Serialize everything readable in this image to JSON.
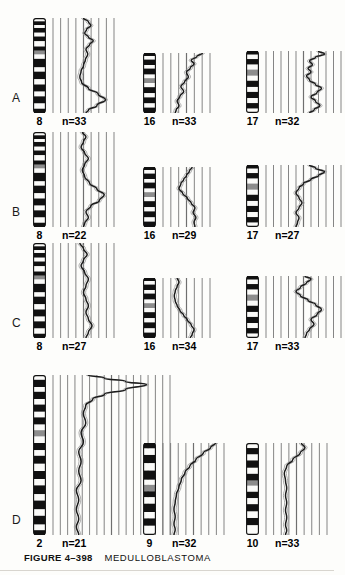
{
  "figure": {
    "number": "FIGURE 4–398",
    "title": "MEDULLOBLASTOMA"
  },
  "panels": [
    {
      "letter": "A",
      "plots": [
        {
          "chromosome": "8",
          "n_label": "n=33"
        },
        {
          "chromosome": "16",
          "n_label": "n=33"
        },
        {
          "chromosome": "17",
          "n_label": "n=32"
        }
      ]
    },
    {
      "letter": "B",
      "plots": [
        {
          "chromosome": "8",
          "n_label": "n=22"
        },
        {
          "chromosome": "16",
          "n_label": "n=29"
        },
        {
          "chromosome": "17",
          "n_label": "n=27"
        }
      ]
    },
    {
      "letter": "C",
      "plots": [
        {
          "chromosome": "8",
          "n_label": "n=27"
        },
        {
          "chromosome": "16",
          "n_label": "n=34"
        },
        {
          "chromosome": "17",
          "n_label": "n=33"
        }
      ]
    },
    {
      "letter": "D",
      "plots": [
        {
          "chromosome": "2",
          "n_label": "n=21"
        },
        {
          "chromosome": "9",
          "n_label": "n=32"
        },
        {
          "chromosome": "10",
          "n_label": "n=33"
        }
      ]
    }
  ],
  "chart_data": {
    "type": "line",
    "title": "MEDULLOBLASTOMA",
    "xlabel": "fluorescence ratio",
    "ylabel": "chromosome position (p → q)",
    "grid": true,
    "legend": "none",
    "panels": [
      {
        "panel": "A",
        "plots": [
          {
            "chromosome": "8",
            "n": 33,
            "gridlines": 9,
            "arm_split": 0.38,
            "profile": [
              [
                0.5,
                0.0
              ],
              [
                0.58,
                0.04
              ],
              [
                0.62,
                0.08
              ],
              [
                0.55,
                0.12
              ],
              [
                0.52,
                0.16
              ],
              [
                0.58,
                0.2
              ],
              [
                0.66,
                0.24
              ],
              [
                0.6,
                0.28
              ],
              [
                0.54,
                0.33
              ],
              [
                0.57,
                0.38
              ],
              [
                0.53,
                0.44
              ],
              [
                0.5,
                0.5
              ],
              [
                0.46,
                0.56
              ],
              [
                0.44,
                0.62
              ],
              [
                0.47,
                0.68
              ],
              [
                0.58,
                0.74
              ],
              [
                0.74,
                0.8
              ],
              [
                0.86,
                0.86
              ],
              [
                0.72,
                0.92
              ],
              [
                0.58,
                0.97
              ],
              [
                0.54,
                1.0
              ]
            ]
          },
          {
            "chromosome": "16",
            "n": 33,
            "gridlines": 7,
            "arm_split": 0.42,
            "profile": [
              [
                0.84,
                0.0
              ],
              [
                0.72,
                0.06
              ],
              [
                0.6,
                0.12
              ],
              [
                0.66,
                0.18
              ],
              [
                0.58,
                0.25
              ],
              [
                0.5,
                0.32
              ],
              [
                0.54,
                0.4
              ],
              [
                0.46,
                0.48
              ],
              [
                0.38,
                0.56
              ],
              [
                0.44,
                0.64
              ],
              [
                0.36,
                0.72
              ],
              [
                0.3,
                0.8
              ],
              [
                0.34,
                0.88
              ],
              [
                0.28,
                0.95
              ],
              [
                0.26,
                1.0
              ]
            ]
          },
          {
            "chromosome": "17",
            "n": 32,
            "gridlines": 11,
            "arm_split": 0.4,
            "profile": [
              [
                0.7,
                0.0
              ],
              [
                0.78,
                0.05
              ],
              [
                0.66,
                0.1
              ],
              [
                0.58,
                0.16
              ],
              [
                0.62,
                0.22
              ],
              [
                0.56,
                0.28
              ],
              [
                0.6,
                0.34
              ],
              [
                0.54,
                0.4
              ],
              [
                0.58,
                0.47
              ],
              [
                0.66,
                0.54
              ],
              [
                0.74,
                0.6
              ],
              [
                0.68,
                0.67
              ],
              [
                0.6,
                0.74
              ],
              [
                0.66,
                0.81
              ],
              [
                0.72,
                0.88
              ],
              [
                0.64,
                0.95
              ],
              [
                0.58,
                1.0
              ]
            ]
          }
        ]
      },
      {
        "panel": "B",
        "plots": [
          {
            "chromosome": "8",
            "n": 22,
            "gridlines": 9,
            "arm_split": 0.38,
            "profile": [
              [
                0.48,
                0.0
              ],
              [
                0.54,
                0.05
              ],
              [
                0.5,
                0.1
              ],
              [
                0.46,
                0.16
              ],
              [
                0.52,
                0.22
              ],
              [
                0.58,
                0.28
              ],
              [
                0.52,
                0.34
              ],
              [
                0.48,
                0.4
              ],
              [
                0.52,
                0.47
              ],
              [
                0.6,
                0.54
              ],
              [
                0.72,
                0.6
              ],
              [
                0.84,
                0.66
              ],
              [
                0.76,
                0.72
              ],
              [
                0.62,
                0.78
              ],
              [
                0.54,
                0.84
              ],
              [
                0.58,
                0.9
              ],
              [
                0.52,
                0.96
              ],
              [
                0.5,
                1.0
              ]
            ]
          },
          {
            "chromosome": "16",
            "n": 29,
            "gridlines": 7,
            "arm_split": 0.42,
            "profile": [
              [
                0.62,
                0.0
              ],
              [
                0.56,
                0.07
              ],
              [
                0.5,
                0.14
              ],
              [
                0.44,
                0.21
              ],
              [
                0.38,
                0.28
              ],
              [
                0.34,
                0.36
              ],
              [
                0.42,
                0.44
              ],
              [
                0.52,
                0.52
              ],
              [
                0.6,
                0.6
              ],
              [
                0.68,
                0.68
              ],
              [
                0.64,
                0.76
              ],
              [
                0.7,
                0.84
              ],
              [
                0.66,
                0.92
              ],
              [
                0.68,
                1.0
              ]
            ]
          },
          {
            "chromosome": "17",
            "n": 27,
            "gridlines": 11,
            "arm_split": 0.4,
            "profile": [
              [
                0.58,
                0.0
              ],
              [
                0.66,
                0.05
              ],
              [
                0.78,
                0.11
              ],
              [
                0.7,
                0.17
              ],
              [
                0.6,
                0.23
              ],
              [
                0.5,
                0.3
              ],
              [
                0.44,
                0.37
              ],
              [
                0.4,
                0.45
              ],
              [
                0.44,
                0.53
              ],
              [
                0.48,
                0.61
              ],
              [
                0.44,
                0.69
              ],
              [
                0.4,
                0.77
              ],
              [
                0.44,
                0.85
              ],
              [
                0.42,
                0.93
              ],
              [
                0.4,
                1.0
              ]
            ]
          }
        ]
      },
      {
        "panel": "C",
        "plots": [
          {
            "chromosome": "8",
            "n": 27,
            "gridlines": 9,
            "arm_split": 0.38,
            "profile": [
              [
                0.44,
                0.0
              ],
              [
                0.5,
                0.06
              ],
              [
                0.56,
                0.12
              ],
              [
                0.5,
                0.18
              ],
              [
                0.46,
                0.24
              ],
              [
                0.52,
                0.31
              ],
              [
                0.58,
                0.38
              ],
              [
                0.54,
                0.45
              ],
              [
                0.5,
                0.52
              ],
              [
                0.54,
                0.59
              ],
              [
                0.58,
                0.66
              ],
              [
                0.54,
                0.73
              ],
              [
                0.58,
                0.8
              ],
              [
                0.64,
                0.87
              ],
              [
                0.58,
                0.94
              ],
              [
                0.54,
                1.0
              ]
            ]
          },
          {
            "chromosome": "16",
            "n": 34,
            "gridlines": 7,
            "arm_split": 0.42,
            "profile": [
              [
                0.3,
                0.0
              ],
              [
                0.34,
                0.07
              ],
              [
                0.3,
                0.14
              ],
              [
                0.26,
                0.22
              ],
              [
                0.24,
                0.3
              ],
              [
                0.26,
                0.38
              ],
              [
                0.3,
                0.46
              ],
              [
                0.36,
                0.54
              ],
              [
                0.44,
                0.62
              ],
              [
                0.52,
                0.7
              ],
              [
                0.6,
                0.78
              ],
              [
                0.66,
                0.86
              ],
              [
                0.62,
                0.94
              ],
              [
                0.58,
                1.0
              ]
            ]
          },
          {
            "chromosome": "17",
            "n": 33,
            "gridlines": 11,
            "arm_split": 0.4,
            "profile": [
              [
                0.52,
                0.0
              ],
              [
                0.6,
                0.05
              ],
              [
                0.54,
                0.11
              ],
              [
                0.46,
                0.18
              ],
              [
                0.4,
                0.25
              ],
              [
                0.46,
                0.32
              ],
              [
                0.56,
                0.39
              ],
              [
                0.66,
                0.46
              ],
              [
                0.74,
                0.54
              ],
              [
                0.68,
                0.62
              ],
              [
                0.6,
                0.7
              ],
              [
                0.64,
                0.78
              ],
              [
                0.58,
                0.86
              ],
              [
                0.54,
                0.93
              ],
              [
                0.52,
                1.0
              ]
            ]
          }
        ]
      },
      {
        "panel": "D",
        "plots": [
          {
            "chromosome": "2",
            "n": 21,
            "gridlines": 17,
            "arm_split": 0.38,
            "profile": [
              [
                0.3,
                0.0
              ],
              [
                0.44,
                0.02
              ],
              [
                0.62,
                0.04
              ],
              [
                0.8,
                0.06
              ],
              [
                0.62,
                0.09
              ],
              [
                0.44,
                0.12
              ],
              [
                0.34,
                0.15
              ],
              [
                0.28,
                0.19
              ],
              [
                0.26,
                0.24
              ],
              [
                0.28,
                0.3
              ],
              [
                0.24,
                0.36
              ],
              [
                0.26,
                0.42
              ],
              [
                0.22,
                0.48
              ],
              [
                0.24,
                0.54
              ],
              [
                0.22,
                0.6
              ],
              [
                0.24,
                0.66
              ],
              [
                0.2,
                0.72
              ],
              [
                0.22,
                0.78
              ],
              [
                0.2,
                0.84
              ],
              [
                0.22,
                0.9
              ],
              [
                0.2,
                0.95
              ],
              [
                0.22,
                1.0
              ]
            ]
          },
          {
            "chromosome": "9",
            "n": 32,
            "gridlines": 9,
            "arm_split": 0.46,
            "profile": [
              [
                0.86,
                0.0
              ],
              [
                0.78,
                0.05
              ],
              [
                0.66,
                0.11
              ],
              [
                0.54,
                0.18
              ],
              [
                0.44,
                0.25
              ],
              [
                0.36,
                0.32
              ],
              [
                0.3,
                0.4
              ],
              [
                0.26,
                0.48
              ],
              [
                0.22,
                0.56
              ],
              [
                0.2,
                0.64
              ],
              [
                0.18,
                0.72
              ],
              [
                0.2,
                0.8
              ],
              [
                0.18,
                0.88
              ],
              [
                0.2,
                0.94
              ],
              [
                0.18,
                1.0
              ]
            ]
          },
          {
            "chromosome": "10",
            "n": 33,
            "gridlines": 9,
            "arm_split": 0.42,
            "profile": [
              [
                0.58,
                0.0
              ],
              [
                0.64,
                0.05
              ],
              [
                0.56,
                0.11
              ],
              [
                0.44,
                0.18
              ],
              [
                0.34,
                0.25
              ],
              [
                0.3,
                0.33
              ],
              [
                0.32,
                0.41
              ],
              [
                0.34,
                0.49
              ],
              [
                0.32,
                0.57
              ],
              [
                0.34,
                0.65
              ],
              [
                0.32,
                0.73
              ],
              [
                0.34,
                0.81
              ],
              [
                0.32,
                0.89
              ],
              [
                0.34,
                0.95
              ],
              [
                0.32,
                1.0
              ]
            ]
          }
        ]
      }
    ]
  }
}
